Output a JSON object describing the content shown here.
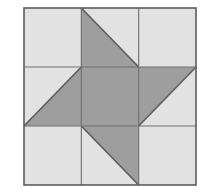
{
  "figure": {
    "type": "quilt-block-diagram",
    "canvas": {
      "width": 219,
      "height": 192,
      "background": "#ffffff"
    }
  },
  "colors": {
    "light": "#e2e2e2",
    "dark": "#9e9e9e",
    "outline": "#5c5c5c",
    "grid_line": "#6e6e6e",
    "background": "#ffffff"
  },
  "block": {
    "x": 24,
    "y": 8,
    "width": 172,
    "height": 177,
    "rows": 3,
    "cols": 3,
    "cell_width": 57.33,
    "cell_height": 59,
    "outline_width": 1.6,
    "grid_width": 1.1
  },
  "grid": {
    "x_lines": [
      24,
      81.33,
      138.67,
      196
    ],
    "y_lines": [
      8,
      67,
      126,
      185
    ]
  },
  "cells": [
    {
      "name": "top-left",
      "row": 0,
      "col": 0,
      "pattern": "solid",
      "fill": "light",
      "label": "Plain light square"
    },
    {
      "name": "top-center",
      "row": 0,
      "col": 1,
      "pattern": "half-square-triangle",
      "dark_corner": "bottom-left",
      "diagonal": "top-left-to-bottom-right",
      "label": "Dark triangle lower-left"
    },
    {
      "name": "top-right",
      "row": 0,
      "col": 2,
      "pattern": "solid",
      "fill": "light",
      "label": "Plain light square"
    },
    {
      "name": "middle-left",
      "row": 1,
      "col": 0,
      "pattern": "half-square-triangle",
      "dark_corner": "bottom-right",
      "diagonal": "top-right-to-bottom-left",
      "label": "Dark triangle lower-right"
    },
    {
      "name": "center",
      "row": 1,
      "col": 1,
      "pattern": "solid",
      "fill": "dark",
      "label": "Solid dark center square"
    },
    {
      "name": "middle-right",
      "row": 1,
      "col": 2,
      "pattern": "half-square-triangle",
      "dark_corner": "top-left",
      "diagonal": "bottom-left-to-top-right",
      "label": "Dark triangle upper-left"
    },
    {
      "name": "bottom-left",
      "row": 2,
      "col": 0,
      "pattern": "solid",
      "fill": "light",
      "label": "Plain light square"
    },
    {
      "name": "bottom-center",
      "row": 2,
      "col": 1,
      "pattern": "half-square-triangle",
      "dark_corner": "top-right",
      "diagonal": "bottom-left-to-top-right",
      "label": "Dark triangle upper-right"
    },
    {
      "name": "bottom-right",
      "row": 2,
      "col": 2,
      "pattern": "solid",
      "fill": "light",
      "label": "Plain light square"
    }
  ]
}
